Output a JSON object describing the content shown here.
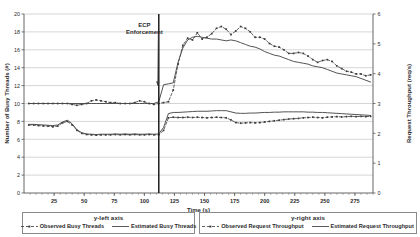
{
  "chart_data": {
    "type": "line",
    "title": "",
    "xlabel": "Time (s)",
    "ylabel": "Number of  Busy Threads (#)",
    "y2label": "Request Throughput (req/s)",
    "xlim": [
      0,
      290
    ],
    "ylim": [
      0,
      20
    ],
    "y2lim": [
      0,
      6
    ],
    "xticks": [
      25,
      50,
      75,
      100,
      125,
      150,
      175,
      200,
      225,
      250,
      275
    ],
    "yticks": [
      0,
      2,
      4,
      6,
      8,
      10,
      12,
      14,
      16,
      18,
      20
    ],
    "y2ticks": [
      0,
      1,
      2,
      3,
      4,
      5,
      6
    ],
    "grid": "horizontal",
    "legend_position": "below-axes",
    "annotations": [
      {
        "text_line1": "ECP",
        "text_line2": "Enforcement",
        "text_x": 100,
        "text_y": 18.6,
        "arrow_to_x": 112,
        "arrow_to_y": 12.0,
        "marker_line_x": 112
      }
    ],
    "series": [
      {
        "name": "Observed Busy Threads",
        "axis": "y-left",
        "style": "dashed-marker",
        "color": "#3a3a3a",
        "x": [
          4,
          8,
          12,
          16,
          20,
          24,
          28,
          32,
          36,
          40,
          44,
          48,
          52,
          56,
          60,
          64,
          68,
          72,
          76,
          80,
          84,
          88,
          92,
          96,
          100,
          104,
          108,
          112,
          116,
          120,
          124,
          128,
          132,
          136,
          140,
          144,
          148,
          152,
          156,
          160,
          164,
          168,
          172,
          176,
          180,
          184,
          188,
          192,
          196,
          200,
          204,
          208,
          212,
          216,
          220,
          224,
          228,
          232,
          236,
          240,
          244,
          248,
          252,
          256,
          260,
          264,
          268,
          272,
          276,
          280,
          284,
          288
        ],
        "y": [
          10.0,
          10.0,
          10.0,
          10.0,
          10.0,
          10.0,
          10.0,
          10.0,
          10.0,
          9.9,
          9.8,
          9.9,
          10.0,
          10.3,
          10.4,
          10.3,
          10.2,
          10.1,
          10.1,
          10.0,
          10.0,
          10.0,
          10.1,
          10.3,
          10.2,
          10.0,
          9.9,
          10.0,
          10.1,
          10.2,
          11.5,
          14.4,
          16.5,
          17.3,
          17.1,
          17.9,
          17.2,
          17.4,
          17.8,
          18.4,
          18.6,
          18.3,
          17.7,
          18.1,
          18.6,
          18.4,
          18.0,
          17.4,
          17.4,
          17.2,
          16.7,
          16.4,
          16.3,
          16.0,
          15.6,
          15.6,
          15.7,
          15.6,
          15.3,
          14.9,
          14.6,
          14.8,
          14.9,
          14.7,
          14.2,
          13.9,
          13.6,
          13.5,
          13.3,
          13.3,
          13.1,
          13.2
        ]
      },
      {
        "name": "Estimated Busy Threads",
        "axis": "y-left",
        "style": "solid",
        "color": "#4a4a4a",
        "x": [
          4,
          8,
          12,
          16,
          20,
          24,
          28,
          32,
          36,
          40,
          44,
          48,
          52,
          56,
          60,
          64,
          68,
          72,
          76,
          80,
          84,
          88,
          92,
          96,
          100,
          104,
          108,
          112,
          116,
          120,
          124,
          128,
          132,
          136,
          140,
          144,
          148,
          152,
          156,
          160,
          164,
          168,
          172,
          176,
          180,
          184,
          188,
          192,
          196,
          200,
          204,
          208,
          212,
          216,
          220,
          224,
          228,
          232,
          236,
          240,
          244,
          248,
          252,
          256,
          260,
          264,
          268,
          272,
          276,
          280,
          284,
          288
        ],
        "y": [
          10.0,
          10.0,
          10.0,
          10.0,
          10.0,
          10.0,
          10.0,
          10.0,
          10.0,
          10.0,
          10.0,
          10.0,
          10.0,
          10.0,
          10.0,
          10.0,
          10.0,
          10.0,
          10.0,
          10.0,
          10.0,
          10.0,
          10.0,
          10.0,
          10.0,
          10.0,
          10.0,
          10.2,
          12.1,
          12.2,
          12.3,
          14.6,
          16.2,
          17.1,
          17.4,
          17.5,
          17.4,
          17.3,
          17.2,
          17.2,
          17.1,
          17.0,
          17.1,
          17.0,
          16.8,
          16.6,
          16.4,
          16.3,
          16.1,
          15.8,
          15.6,
          15.4,
          15.3,
          15.1,
          14.9,
          14.7,
          14.6,
          14.5,
          14.4,
          14.2,
          14.1,
          14.0,
          13.8,
          13.6,
          13.4,
          13.3,
          13.2,
          13.1,
          13.0,
          12.8,
          12.6,
          12.4
        ]
      },
      {
        "name": "Observed Request Throughput",
        "axis": "y-right",
        "style": "dashed-marker",
        "color": "#3a3a3a",
        "x": [
          4,
          8,
          12,
          16,
          20,
          24,
          28,
          32,
          36,
          40,
          44,
          48,
          52,
          56,
          60,
          64,
          68,
          72,
          76,
          80,
          84,
          88,
          92,
          96,
          100,
          104,
          108,
          112,
          116,
          120,
          124,
          128,
          132,
          136,
          140,
          144,
          148,
          152,
          156,
          160,
          164,
          168,
          172,
          176,
          180,
          184,
          188,
          192,
          196,
          200,
          204,
          208,
          212,
          216,
          220,
          224,
          228,
          232,
          236,
          240,
          244,
          248,
          252,
          256,
          260,
          264,
          268,
          272,
          276,
          280,
          284,
          288
        ],
        "y": [
          2.28,
          2.28,
          2.26,
          2.25,
          2.24,
          2.22,
          2.24,
          2.35,
          2.4,
          2.28,
          2.1,
          2.0,
          1.96,
          1.95,
          1.94,
          1.95,
          1.95,
          1.95,
          1.96,
          1.95,
          1.96,
          1.95,
          1.96,
          1.95,
          1.95,
          1.96,
          1.95,
          1.95,
          2.1,
          2.52,
          2.54,
          2.53,
          2.53,
          2.54,
          2.53,
          2.54,
          2.53,
          2.52,
          2.53,
          2.54,
          2.53,
          2.52,
          2.45,
          2.36,
          2.34,
          2.35,
          2.36,
          2.35,
          2.36,
          2.38,
          2.4,
          2.42,
          2.44,
          2.46,
          2.48,
          2.49,
          2.5,
          2.52,
          2.53,
          2.54,
          2.53,
          2.52,
          2.54,
          2.55,
          2.56,
          2.55,
          2.56,
          2.57,
          2.56,
          2.57,
          2.56,
          2.57
        ]
      },
      {
        "name": "Estimated Request Throughput",
        "axis": "y-right",
        "style": "solid",
        "color": "#4a4a4a",
        "x": [
          4,
          8,
          12,
          16,
          20,
          24,
          28,
          32,
          36,
          40,
          44,
          48,
          52,
          56,
          60,
          64,
          68,
          72,
          76,
          80,
          84,
          88,
          92,
          96,
          100,
          104,
          108,
          112,
          116,
          120,
          124,
          128,
          132,
          136,
          140,
          144,
          148,
          152,
          156,
          160,
          164,
          168,
          172,
          176,
          180,
          184,
          188,
          192,
          196,
          200,
          204,
          208,
          212,
          216,
          220,
          224,
          228,
          232,
          236,
          240,
          244,
          248,
          252,
          256,
          260,
          264,
          268,
          272,
          276,
          280,
          284,
          288
        ],
        "y": [
          2.3,
          2.3,
          2.29,
          2.28,
          2.27,
          2.26,
          2.28,
          2.38,
          2.44,
          2.32,
          2.12,
          2.02,
          1.98,
          1.97,
          1.96,
          1.97,
          1.97,
          1.97,
          1.98,
          1.97,
          1.98,
          1.97,
          1.98,
          1.97,
          1.97,
          1.98,
          1.97,
          1.98,
          2.2,
          2.66,
          2.7,
          2.7,
          2.71,
          2.72,
          2.73,
          2.74,
          2.74,
          2.74,
          2.75,
          2.76,
          2.76,
          2.76,
          2.72,
          2.68,
          2.67,
          2.67,
          2.68,
          2.68,
          2.69,
          2.7,
          2.7,
          2.71,
          2.71,
          2.72,
          2.72,
          2.72,
          2.72,
          2.72,
          2.71,
          2.71,
          2.7,
          2.7,
          2.69,
          2.68,
          2.67,
          2.66,
          2.65,
          2.64,
          2.63,
          2.62,
          2.61,
          2.6
        ]
      }
    ]
  },
  "legend": {
    "left_group": {
      "title": "y-left axis",
      "entries": [
        {
          "label": "Observed Busy Threads",
          "style": "dashed-marker"
        },
        {
          "label": "Estimated Busy Threads",
          "style": "solid"
        }
      ]
    },
    "right_group": {
      "title": "y-right axis",
      "entries": [
        {
          "label": "Observed Request Throughput",
          "style": "dashed-marker"
        },
        {
          "label": "Estimated Request Throughput",
          "style": "solid"
        }
      ]
    }
  }
}
